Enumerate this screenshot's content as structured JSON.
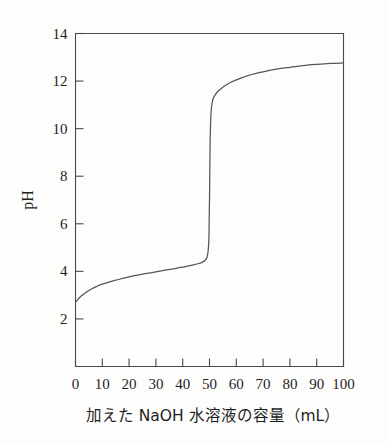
{
  "chart_data": {
    "type": "line",
    "title": "",
    "subtitle": "",
    "xlabel": "加えた NaOH 水溶液の容量（mL）",
    "ylabel": "pH",
    "xlim": [
      0,
      100
    ],
    "ylim": [
      0,
      14
    ],
    "grid": false,
    "legend": null,
    "x_ticks": [
      0,
      10,
      20,
      30,
      40,
      50,
      60,
      70,
      80,
      90,
      100
    ],
    "x_tick_labels": [
      "0",
      "10",
      "20",
      "30",
      "40",
      "50",
      "60",
      "70",
      "80",
      "90",
      "100"
    ],
    "y_ticks": [
      2,
      4,
      6,
      8,
      10,
      12,
      14
    ],
    "y_tick_labels": [
      "2",
      "4",
      "6",
      "8",
      "10",
      "12",
      "14"
    ],
    "series": [
      {
        "name": "titration-curve",
        "color": "#555555",
        "x": [
          0,
          2,
          4,
          6,
          8,
          10,
          14,
          18,
          22,
          26,
          30,
          34,
          38,
          41,
          44,
          46,
          47,
          48,
          48.5,
          49,
          49.2,
          49.4,
          49.6,
          49.8,
          50,
          50.2,
          50.4,
          50.6,
          51,
          51.5,
          52,
          53,
          54,
          56,
          58,
          60,
          64,
          68,
          72,
          76,
          80,
          85,
          90,
          95,
          100
        ],
        "y": [
          2.7,
          2.95,
          3.12,
          3.26,
          3.37,
          3.46,
          3.6,
          3.72,
          3.82,
          3.9,
          3.98,
          4.06,
          4.14,
          4.2,
          4.27,
          4.33,
          4.37,
          4.43,
          4.48,
          4.58,
          4.66,
          4.78,
          5.0,
          5.5,
          7.0,
          9.2,
          10.2,
          10.7,
          11.1,
          11.3,
          11.4,
          11.55,
          11.65,
          11.82,
          11.95,
          12.05,
          12.22,
          12.34,
          12.44,
          12.52,
          12.58,
          12.65,
          12.7,
          12.74,
          12.76
        ]
      }
    ],
    "annotations": [],
    "notes": {
      "description": "Acid-base titration curve: pH of solution versus volume of added NaOH solution. Starts at pH about 2.7, buffer region rises slowly to about pH 4.4 near 48 mL, then a sharp vertical jump at the equivalence point near 50 mL up to about pH 11.4, then a gradual rise to about pH 12.7 at 100 mL.",
      "equivalence_point_mL": 50,
      "start_pH": 2.7,
      "end_pH": 12.76
    }
  },
  "figure": {
    "background_color": "#fdfdfc",
    "axis_color": "#4a4a4a",
    "curve_color": "#555555",
    "text_color": "#1f1f1f"
  }
}
